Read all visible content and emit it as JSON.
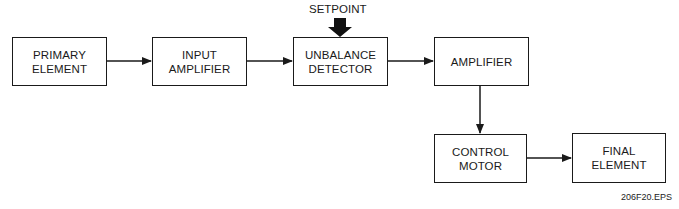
{
  "diagram": {
    "type": "block-diagram",
    "blocks": [
      {
        "id": "primary-element",
        "label": "PRIMARY\nELEMENT",
        "x": 12,
        "y": 37,
        "w": 95,
        "h": 49
      },
      {
        "id": "input-amplifier",
        "label": "INPUT\nAMPLIFIER",
        "x": 152,
        "y": 37,
        "w": 95,
        "h": 49
      },
      {
        "id": "unbalance-detector",
        "label": "UNBALANCE\nDETECTOR",
        "x": 293,
        "y": 37,
        "w": 95,
        "h": 49
      },
      {
        "id": "amplifier",
        "label": "AMPLIFIER",
        "x": 434,
        "y": 37,
        "w": 95,
        "h": 49
      },
      {
        "id": "control-motor",
        "label": "CONTROL\nMOTOR",
        "x": 434,
        "y": 134,
        "w": 93,
        "h": 49
      },
      {
        "id": "final-element",
        "label": "FINAL\nELEMENT",
        "x": 572,
        "y": 133,
        "w": 94,
        "h": 50
      }
    ],
    "connections": [
      {
        "from": "primary-element",
        "to": "input-amplifier"
      },
      {
        "from": "input-amplifier",
        "to": "unbalance-detector"
      },
      {
        "from": "unbalance-detector",
        "to": "amplifier"
      },
      {
        "from": "amplifier",
        "to": "control-motor"
      },
      {
        "from": "control-motor",
        "to": "final-element"
      }
    ],
    "inputs": [
      {
        "label": "SETPOINT",
        "to": "unbalance-detector",
        "style": "thick-arrow"
      }
    ],
    "caption": "206F20.EPS",
    "colors": {
      "stroke": "#1a1a1a",
      "background": "#ffffff"
    }
  }
}
